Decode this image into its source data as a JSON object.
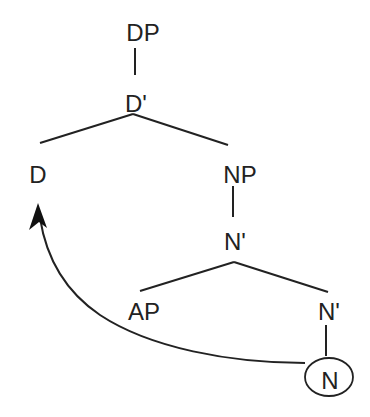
{
  "diagram": {
    "type": "syntax-tree",
    "colors": {
      "line": "#222222",
      "text": "#222222",
      "background": "#ffffff"
    },
    "nodes": [
      {
        "id": "dp",
        "label": "DP",
        "x": 143,
        "y": 33
      },
      {
        "id": "dbar",
        "label": "D'",
        "x": 136,
        "y": 104
      },
      {
        "id": "d",
        "label": "D",
        "x": 38,
        "y": 175
      },
      {
        "id": "np",
        "label": "NP",
        "x": 240,
        "y": 175
      },
      {
        "id": "nbar1",
        "label": "N'",
        "x": 235,
        "y": 242
      },
      {
        "id": "ap",
        "label": "AP",
        "x": 144,
        "y": 312
      },
      {
        "id": "nbar2",
        "label": "N'",
        "x": 329,
        "y": 312
      },
      {
        "id": "n",
        "label": "N",
        "x": 330,
        "y": 381
      }
    ],
    "edges": [
      {
        "from": "dp",
        "to": "dbar"
      },
      {
        "from": "dbar",
        "to": "d"
      },
      {
        "from": "dbar",
        "to": "np"
      },
      {
        "from": "np",
        "to": "nbar1"
      },
      {
        "from": "nbar1",
        "to": "ap"
      },
      {
        "from": "nbar1",
        "to": "nbar2"
      },
      {
        "from": "nbar2",
        "to": "n"
      }
    ],
    "highlight": {
      "node": "n",
      "shape": "ellipse"
    },
    "movement_arrow": {
      "from": "n",
      "to": "d",
      "description": "head movement N to D"
    }
  }
}
